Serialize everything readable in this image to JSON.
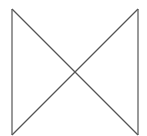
{
  "diagram": {
    "shape": "bowtie",
    "stroke_color": "#555555",
    "background": "#ffffff",
    "lines": [
      {
        "name": "left-vertical",
        "x1": 12,
        "y1": 9,
        "x2": 12,
        "y2": 135
      },
      {
        "name": "right-vertical",
        "x1": 138,
        "y1": 9,
        "x2": 138,
        "y2": 135
      },
      {
        "name": "diagonal-down",
        "x1": 12,
        "y1": 9,
        "x2": 138,
        "y2": 135
      },
      {
        "name": "diagonal-up",
        "x1": 12,
        "y1": 135,
        "x2": 138,
        "y2": 9
      }
    ]
  }
}
